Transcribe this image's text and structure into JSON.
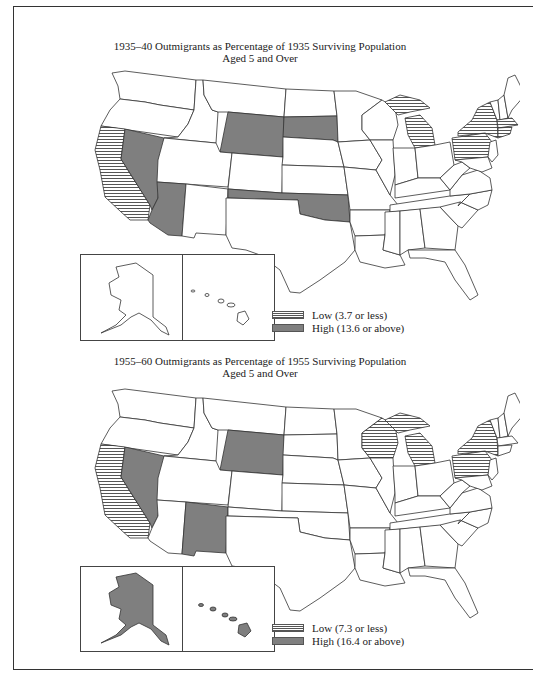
{
  "maps": [
    {
      "title_line1": "1935–40 Outmigrants as Percentage of 1935 Surviving Population",
      "title_line2": "Aged 5 and Over",
      "legend": {
        "low_label": "Low (3.7 or less)",
        "high_label": "High (13.6 or above)"
      },
      "low_states": [
        "California",
        "Michigan",
        "New York",
        "Pennsylvania",
        "Massachusetts",
        "Connecticut"
      ],
      "high_states": [
        "Nevada",
        "Arizona",
        "Wyoming",
        "South Dakota",
        "Oklahoma"
      ]
    },
    {
      "title_line1": "1955–60 Outmigrants as Percentage of 1955 Surviving Population",
      "title_line2": "Aged 5 and Over",
      "legend": {
        "low_label": "Low (7.3 or less)",
        "high_label": "High (16.4 or above)"
      },
      "low_states": [
        "California",
        "Wisconsin",
        "Michigan",
        "New York",
        "Pennsylvania"
      ],
      "high_states": [
        "Nevada",
        "Wyoming",
        "New Mexico",
        "Alaska",
        "Hawaii"
      ]
    }
  ],
  "colors": {
    "high_fill": "#7f7f7f",
    "low_hatch": "#555555",
    "border": "#333333"
  }
}
